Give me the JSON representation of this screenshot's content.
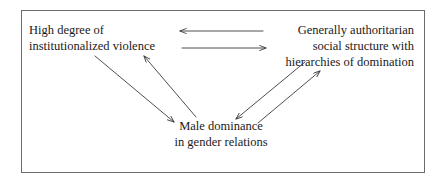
{
  "diagram": {
    "type": "cycle-diagram",
    "border_color": "#6b6b6b",
    "text_color": "#1a1a1a",
    "arrow_color": "#3a3a3a",
    "background": "#ffffff",
    "nodes": [
      {
        "id": "institutionalized-violence",
        "align": "left",
        "lines": [
          "High degree of",
          "institutionalized violence"
        ]
      },
      {
        "id": "authoritarian-social-structure",
        "align": "right",
        "lines": [
          "Generally authoritarian",
          "social structure with",
          "hierarchies of domination"
        ]
      },
      {
        "id": "male-dominance",
        "align": "center",
        "lines": [
          "Male dominance",
          "in gender relations"
        ]
      }
    ],
    "arrows": [
      {
        "id": "arrow-authoritarian-to-violence",
        "from": "authoritarian-social-structure",
        "to": "institutionalized-violence",
        "direction": "left",
        "glyph": "left-arrow-icon"
      },
      {
        "id": "arrow-violence-to-authoritarian",
        "from": "institutionalized-violence",
        "to": "authoritarian-social-structure",
        "direction": "right",
        "glyph": "right-arrow-icon"
      },
      {
        "id": "arrow-violence-to-male-dominance",
        "from": "institutionalized-violence",
        "to": "male-dominance",
        "direction": "down-right",
        "glyph": "down-right-arrow-icon"
      },
      {
        "id": "arrow-male-dominance-to-violence",
        "from": "male-dominance",
        "to": "institutionalized-violence",
        "direction": "up-left",
        "glyph": "up-left-arrow-icon"
      },
      {
        "id": "arrow-authoritarian-to-male-dominance",
        "from": "authoritarian-social-structure",
        "to": "male-dominance",
        "direction": "down-left",
        "glyph": "down-left-arrow-icon"
      },
      {
        "id": "arrow-male-dominance-to-authoritarian",
        "from": "male-dominance",
        "to": "authoritarian-social-structure",
        "direction": "up-right",
        "glyph": "up-right-arrow-icon"
      }
    ]
  }
}
